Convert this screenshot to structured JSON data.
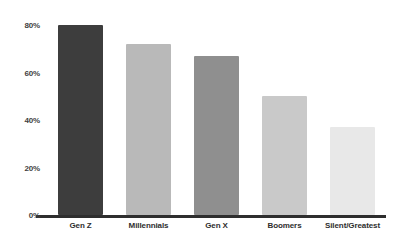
{
  "chart_data": {
    "type": "bar",
    "title": "",
    "subtitle": "",
    "xlabel": "",
    "ylabel": "",
    "categories": [
      "Gen Z",
      "Millennials",
      "Gen X",
      "Boomers",
      "Silent/Greatest"
    ],
    "values": [
      80,
      72,
      67,
      50,
      37
    ],
    "value_labels": [
      "80%",
      "72%",
      "67%",
      "50%",
      "37%"
    ],
    "ylim": [
      0,
      80
    ],
    "y_ticks": [
      0,
      20,
      40,
      60,
      80
    ],
    "y_tick_labels": [
      "0%",
      "20%",
      "40%",
      "60%",
      "80%"
    ],
    "grid": false,
    "legend": false,
    "bar_colors": [
      "#3d3d3d",
      "#b9b9b9",
      "#8f8f8f",
      "#c9c9c9",
      "#e8e8e8"
    ],
    "axis_color": "#2e2e2e",
    "background": "#ffffff"
  }
}
